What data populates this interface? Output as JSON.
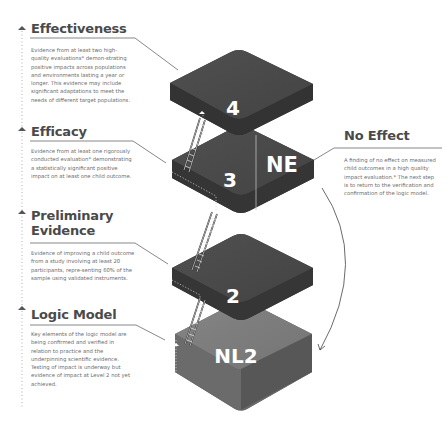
{
  "levels": [
    {
      "id": "effectiveness",
      "title": "Effectiveness",
      "badge": "4",
      "description": "Evidence from at least two high-quality evaluations* demon-strating positive impacts across populations and environments lasting a year or longer. This evidence may include significant adaptations to meet the needs of different target populations."
    },
    {
      "id": "efficacy",
      "title": "Efficacy",
      "badge": "3",
      "description": "Evidence from at least one rigorously conducted evaluation* demonstrating a statistically significant positive impact on at least one child outcome."
    },
    {
      "id": "preliminary-evidence",
      "title": "Preliminary Evidence",
      "badge": "2",
      "description": "Evidence of improving a child outcome from a study involving at least 20 participants, repre-senting 60% of the sample using validated instruments."
    },
    {
      "id": "logic-model",
      "title": "Logic Model",
      "badge": "NL2",
      "description": "Key elements of the logic model are being confirmed and verified in relation to practice and the underpinning scientific evidence. Testing of impact is underway but evidence of impact at Level 2 not yet achieved."
    }
  ],
  "no_effect": {
    "title": "No Effect",
    "badge": "NE",
    "description": "A finding of no effect on measured child outcomes in a high quality impact evaluation.* The next step is to return to the verification and confirmation of the logic model."
  },
  "colors": {
    "block_dark_top": "#4b4b4b",
    "block_dark_side": "#2f2f2f",
    "block_light_top": "#7a7a7a",
    "block_light_side": "#5c5c5c",
    "heading": "#4a4a4a",
    "text": "#6a6a6a",
    "line": "#555555"
  },
  "icons": {
    "level_marker": "up-arrow-icon",
    "ladder": "ladder-icon",
    "return_arrow": "curved-arrow-icon"
  }
}
